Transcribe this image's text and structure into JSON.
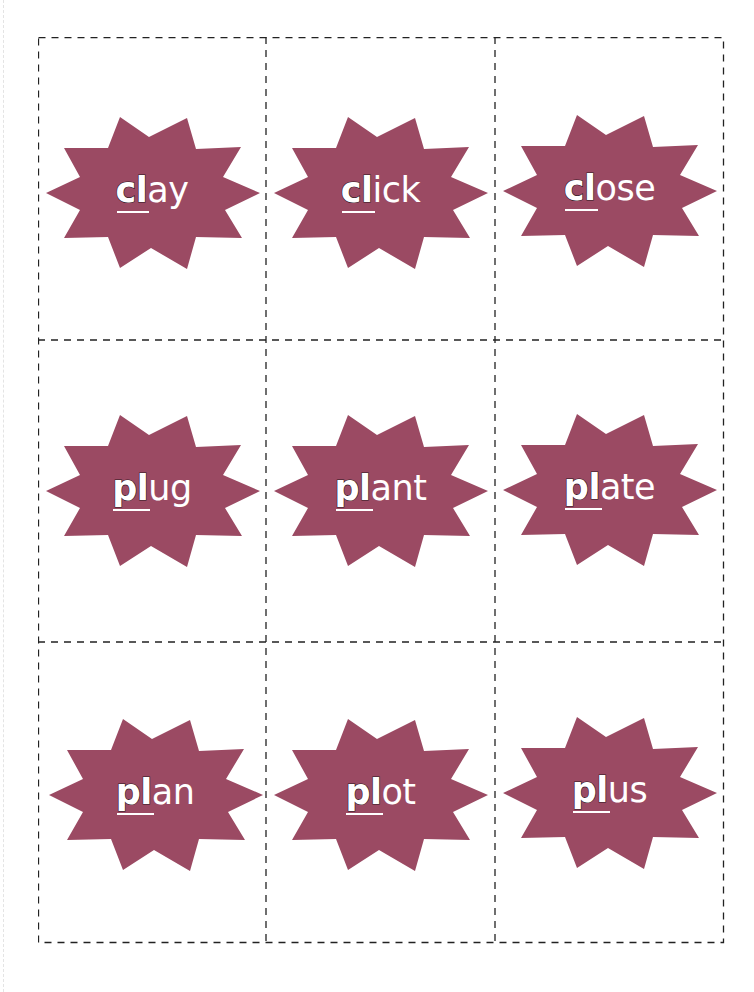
{
  "theme": {
    "star_color": "#9b4a63",
    "text_color": "#ffffff",
    "outline_color": "#2b1620",
    "cut_line_color": "#222222"
  },
  "cards": [
    {
      "blend": "cl",
      "rest": "ay",
      "word": "clay"
    },
    {
      "blend": "cl",
      "rest": "ick",
      "word": "click"
    },
    {
      "blend": "cl",
      "rest": "ose",
      "word": "close"
    },
    {
      "blend": "pl",
      "rest": "ug",
      "word": "plug"
    },
    {
      "blend": "pl",
      "rest": "ant",
      "word": "plant"
    },
    {
      "blend": "pl",
      "rest": "ate",
      "word": "plate"
    },
    {
      "blend": "pl",
      "rest": "an",
      "word": "plan"
    },
    {
      "blend": "pl",
      "rest": "ot",
      "word": "plot"
    },
    {
      "blend": "pl",
      "rest": "us",
      "word": "plus"
    }
  ]
}
